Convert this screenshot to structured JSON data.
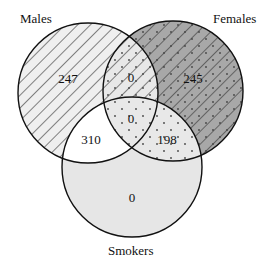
{
  "diagram": {
    "type": "venn",
    "caption_fragment": "",
    "sets": [
      {
        "name": "Males",
        "label": "Males",
        "fill": "#eeeeee",
        "pattern": "diagonal-lines"
      },
      {
        "name": "Females",
        "label": "Females",
        "fill": "#a6a6a6",
        "pattern": "diagonal-lines-dots"
      },
      {
        "name": "Smokers",
        "label": "Smokers",
        "fill": "#e6e6e6",
        "pattern": "none"
      }
    ],
    "regions": {
      "males_only": "247",
      "females_only": "245",
      "males_females_only": "0",
      "males_females_smokers": "0",
      "males_smokers_only": "310",
      "females_smokers_only": "198",
      "smokers_only": "0"
    }
  }
}
